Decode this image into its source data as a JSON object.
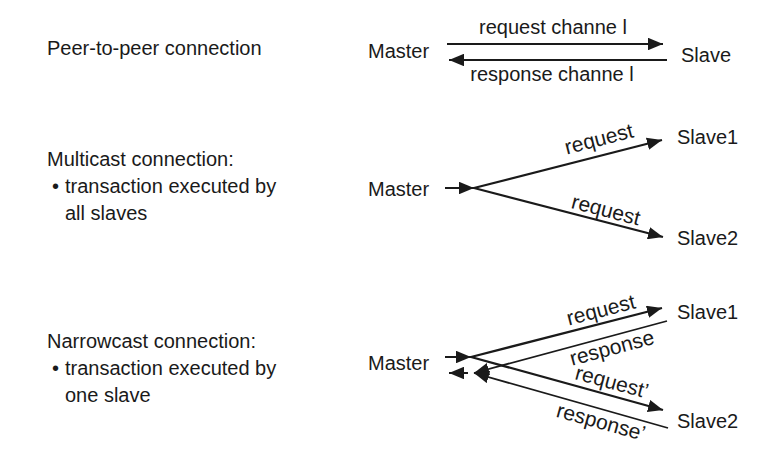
{
  "colors": {
    "background": "#ffffff",
    "ink": "#1a1a1a"
  },
  "sections": {
    "peer": {
      "title": "Peer-to-peer connection",
      "master": "Master",
      "slave": "Slave",
      "request_label": "request channe l",
      "response_label": "response channe l"
    },
    "multicast": {
      "title": "Multicast connection:",
      "bullet_char": "•",
      "bullet_text": "transaction executed by all slaves",
      "master": "Master",
      "slave1": "Slave1",
      "slave2": "Slave2",
      "request_upper_label": "request",
      "request_lower_label": "request"
    },
    "narrowcast": {
      "title": "Narrowcast connection:",
      "bullet_char": "•",
      "bullet_text": "transaction executed by one slave",
      "master": "Master",
      "slave1": "Slave1",
      "slave2": "Slave2",
      "request_label": "request",
      "response_label": "response",
      "request_prime_label": "request’",
      "response_prime_label": "response’"
    }
  }
}
